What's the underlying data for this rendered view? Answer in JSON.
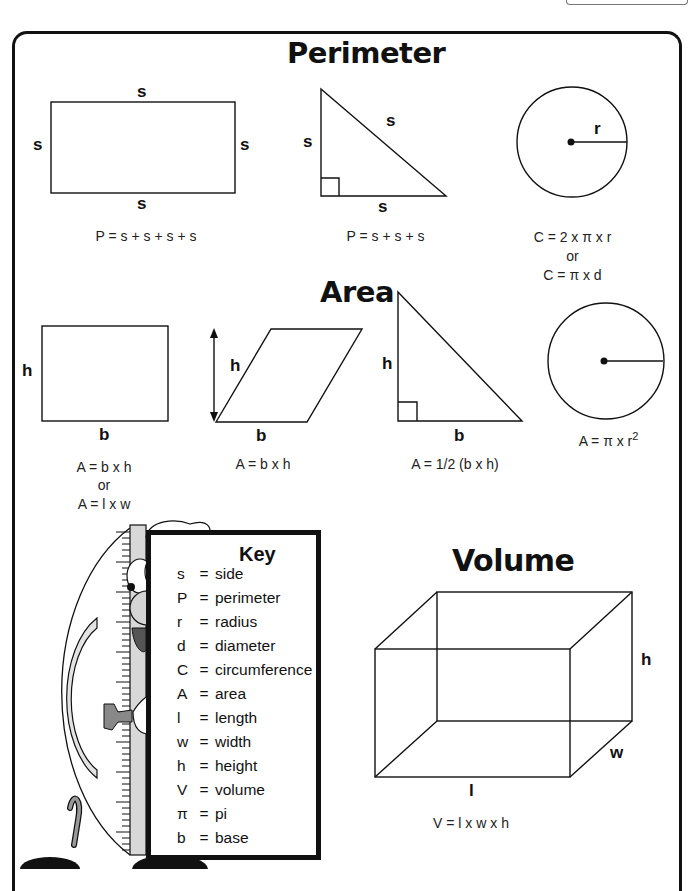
{
  "sections": {
    "perimeter": {
      "title": "Perimeter",
      "rectangle": {
        "labels": {
          "top": "s",
          "bottom": "s",
          "left": "s",
          "right": "s"
        },
        "formula": "P = s + s + s + s"
      },
      "triangle": {
        "labels": {
          "left": "s",
          "hypotenuse": "s",
          "bottom": "s"
        },
        "formula": "P = s + s + s"
      },
      "circle": {
        "labels": {
          "radius": "r"
        },
        "formula_lines": [
          "C = 2 x π x r",
          "or",
          "C = π x d"
        ]
      }
    },
    "area": {
      "title": "Area",
      "rectangle": {
        "labels": {
          "height": "h",
          "base": "b"
        },
        "formula_lines": [
          "A = b x h",
          "or",
          "A = l x w"
        ]
      },
      "parallelogram": {
        "labels": {
          "height": "h",
          "base": "b"
        },
        "formula": "A = b x h"
      },
      "triangle": {
        "labels": {
          "height": "h",
          "base": "b"
        },
        "formula": "A = 1/2 (b x h)"
      },
      "circle": {
        "formula_prefix": "A = π x r",
        "formula_exponent": "2"
      }
    },
    "volume": {
      "title": "Volume",
      "prism": {
        "labels": {
          "length": "l",
          "width": "w",
          "height": "h"
        },
        "formula": "V = l x w x h"
      }
    }
  },
  "key": {
    "title": "Key",
    "items": [
      {
        "symbol": "s",
        "meaning": "side"
      },
      {
        "symbol": "P",
        "meaning": "perimeter"
      },
      {
        "symbol": "r",
        "meaning": "radius"
      },
      {
        "symbol": "d",
        "meaning": "diameter"
      },
      {
        "symbol": "C",
        "meaning": "circumference"
      },
      {
        "symbol": "A",
        "meaning": "area"
      },
      {
        "symbol": "l",
        "meaning": "length"
      },
      {
        "symbol": "w",
        "meaning": "width"
      },
      {
        "symbol": "h",
        "meaning": "height"
      },
      {
        "symbol": "V",
        "meaning": "volume"
      },
      {
        "symbol": "π",
        "meaning": "pi"
      },
      {
        "symbol": "b",
        "meaning": "base"
      }
    ],
    "equals": "="
  },
  "colors": {
    "ink": "#111111",
    "gray_fill": "#d9d9d9",
    "dark_gray": "#777777"
  }
}
